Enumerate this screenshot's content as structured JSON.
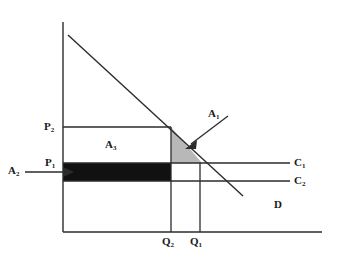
{
  "diagram": {
    "axes": {
      "y_axis": {
        "name": "price-axis",
        "x": 63,
        "y_top": 22,
        "y_bottom": 232
      },
      "x_axis": {
        "name": "quantity-axis",
        "y": 232,
        "x_left": 63,
        "x_right": 322
      }
    },
    "colors": {
      "line": "#2b2b2b",
      "area_a1_fill": "#b8b8b8",
      "area_a2_fill": "#111111",
      "area_a3_fill": "#ffffff",
      "background": "#ffffff"
    },
    "labels": {
      "p2": "P",
      "p2_sub": "2",
      "p1": "P",
      "p1_sub": "1",
      "a1": "A",
      "a1_sub": "1",
      "a2": "A",
      "a2_sub": "2",
      "a3": "A",
      "a3_sub": "3",
      "c1": "C",
      "c1_sub": "1",
      "c2": "C",
      "c2_sub": "2",
      "d": "D",
      "q2": "Q",
      "q2_sub": "2",
      "q1": "Q",
      "q1_sub": "1"
    },
    "geometry": {
      "demand_line": {
        "x1": 68,
        "y1": 35,
        "x2": 243,
        "y2": 196
      },
      "c1_line": {
        "x1": 63,
        "y1": 163,
        "x2": 290,
        "y2": 163
      },
      "c2_line": {
        "x1": 63,
        "y1": 181,
        "x2": 290,
        "y2": 181
      },
      "p2_line": {
        "x1": 63,
        "y1": 127,
        "x2": 171,
        "y2": 127
      },
      "p1_line": {
        "x1": 63,
        "y1": 163,
        "x2": 171,
        "y2": 163
      },
      "q2_line": {
        "x": 171,
        "y_top": 127,
        "y_bottom": 232
      },
      "q1_line": {
        "x": 200,
        "y_top": 163,
        "y_bottom": 232
      },
      "triangle_a1": {
        "points": "171,127 171,163 202,163"
      },
      "rect_a2": {
        "x": 63,
        "y": 163,
        "width": 108,
        "height": 18
      },
      "rect_a3": {
        "x": 63,
        "y": 127,
        "width": 108,
        "height": 36
      },
      "arrow_a1": {
        "x1": 228,
        "y1": 118,
        "x2": 189,
        "y2": 146
      },
      "arrow_a2": {
        "x1": 25,
        "y1": 172,
        "x2": 71,
        "y2": 172
      }
    }
  }
}
